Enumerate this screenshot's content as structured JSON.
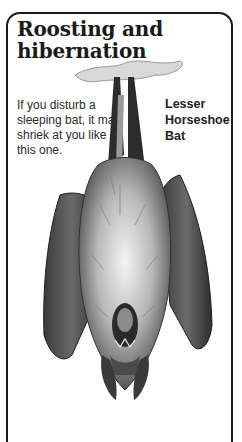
{
  "page": {
    "title": "Roosting and hibernation",
    "title_lines": [
      "Roosting and",
      "hibernation"
    ],
    "caption": "If you disturb a sleeping bat, it may shriek at you like this one.",
    "species_label": "Lesser Horseshoe Bat",
    "illustration": "bat-hanging-upside-down-illustration"
  },
  "colors": {
    "frame": "#1a1a1a",
    "background": "#ffffff",
    "text": "#2a2a2a"
  }
}
